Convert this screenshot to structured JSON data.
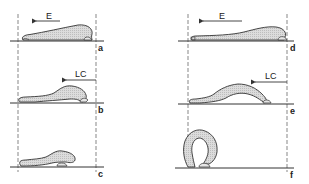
{
  "figure": {
    "colors": {
      "line": "#333333",
      "fill": "#d9d9d9",
      "background": "#ffffff"
    },
    "columns": [
      {
        "name": "left",
        "panels": [
          {
            "id": "a",
            "label": "a",
            "arrow_label": "E",
            "phase": "extension"
          },
          {
            "id": "b",
            "label": "b",
            "arrow_label": "LC",
            "phase": "longitudinal contraction"
          },
          {
            "id": "c",
            "label": "c",
            "arrow_label": "",
            "phase": "contracted"
          }
        ]
      },
      {
        "name": "right",
        "panels": [
          {
            "id": "d",
            "label": "d",
            "arrow_label": "E",
            "phase": "extension"
          },
          {
            "id": "e",
            "label": "e",
            "arrow_label": "LC",
            "phase": "longitudinal contraction"
          },
          {
            "id": "f",
            "label": "f",
            "arrow_label": "",
            "phase": "looped"
          }
        ]
      }
    ],
    "arrow_direction": "left"
  }
}
